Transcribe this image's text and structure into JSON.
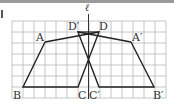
{
  "diagram": {
    "type": "grid-geometry",
    "axis_label": "ℓ",
    "grid": {
      "x0": 12,
      "y0": 21,
      "cell": 11,
      "cols": 14,
      "rows": 7
    },
    "points": {
      "A": {
        "label": "A",
        "x": 45,
        "y": 42
      },
      "B": {
        "label": "B",
        "x": 23,
        "y": 87
      },
      "C": {
        "label": "C",
        "x": 78,
        "y": 87
      },
      "D": {
        "label": "D",
        "x": 99,
        "y": 32
      },
      "A2": {
        "label": "A′",
        "x": 131,
        "y": 42
      },
      "B2": {
        "label": "B′",
        "x": 154,
        "y": 87
      },
      "C2": {
        "label": "C′",
        "x": 99,
        "y": 87
      },
      "D2": {
        "label": "D′",
        "x": 78,
        "y": 32
      }
    },
    "colors": {
      "grid": "#b5b5b5",
      "line": "#222222",
      "text": "#333333"
    }
  }
}
